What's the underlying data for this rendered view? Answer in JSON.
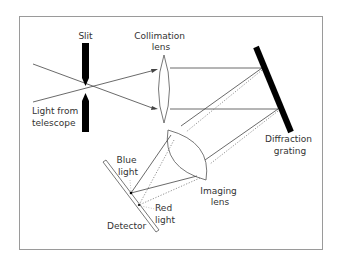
{
  "diagram": {
    "labels": {
      "slit": "Slit",
      "collimation_lens": [
        "Collimation",
        "lens"
      ],
      "light_from_telescope": [
        "Light from",
        "telescope"
      ],
      "diffraction_grating": [
        "Diffraction",
        "grating"
      ],
      "blue_light": [
        "Blue",
        "light"
      ],
      "imaging_lens": [
        "Imaging",
        "lens"
      ],
      "red_light": [
        "Red",
        "light"
      ],
      "detector": "Detector"
    },
    "colors": {
      "frame": "#888888",
      "ray": "#444444",
      "solid": "#000000",
      "text": "#333333"
    }
  }
}
